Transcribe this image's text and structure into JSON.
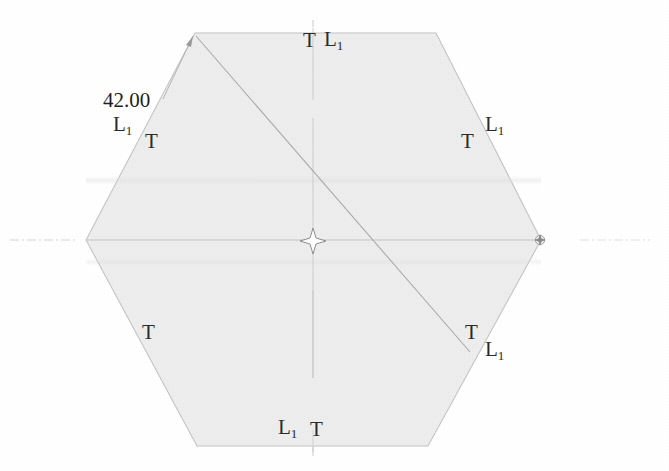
{
  "drawing": {
    "kind": "engineering-drawing",
    "shape": "hexagon",
    "background_color": "#ffffff",
    "fill_color": "#ededed",
    "outline_color": "#c9c9c9",
    "construction_line_color": "#b9b9b9",
    "text_color": "#2b2b2b",
    "dimensions": {
      "across_corners": "42.00"
    },
    "labels": {
      "top": {
        "first": "T",
        "second": "L",
        "second_sub": "1"
      },
      "top_right": {
        "first": "T",
        "second": "L",
        "second_sub": "1"
      },
      "top_left": {
        "first": "L",
        "first_sub": "1",
        "second": "T"
      },
      "bottom_left": {
        "first": "T"
      },
      "bottom_right": {
        "first": "T",
        "second": "L",
        "second_sub": "1"
      },
      "bottom": {
        "first": "L",
        "first_sub": "1",
        "second": "T"
      }
    },
    "markers": {
      "center_mark": "four-point-star",
      "right_vertex_mark": "circle-star",
      "leader_arrow": "arrowhead"
    },
    "geometry": {
      "hex_vertices": [
        [
          195,
          33
        ],
        [
          436,
          33
        ],
        [
          541,
          240
        ],
        [
          428,
          446
        ],
        [
          197,
          446
        ],
        [
          86,
          240
        ]
      ],
      "center": [
        313,
        240
      ],
      "diagonal_from": [
        195,
        33
      ],
      "diagonal_to": [
        470,
        352
      ]
    }
  }
}
